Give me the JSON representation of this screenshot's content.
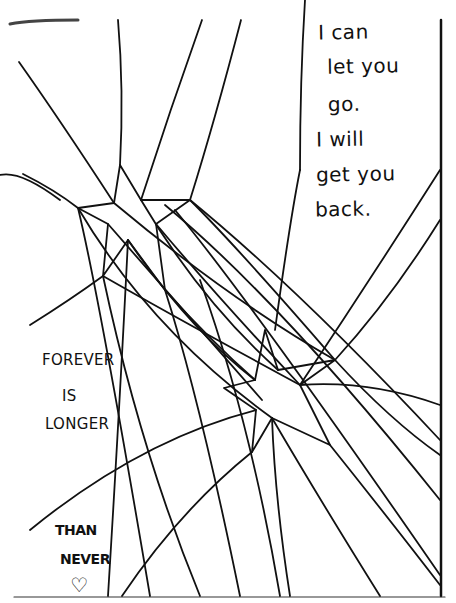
{
  "artwork": {
    "description": "Hand-drawn ink sketch of two shattered stars connected by many radiating lines, with handwritten text",
    "ink_color": "#111111",
    "paper_color": "#ffffff",
    "quote_right": {
      "lines": [
        "I can",
        "let you",
        "go.",
        "I will",
        "get you",
        "back."
      ]
    },
    "quote_left": {
      "lines": [
        "FOREVER",
        "IS",
        "LONGER"
      ]
    },
    "quote_bottom": {
      "lines": [
        "THAN",
        "NEVER"
      ],
      "symbol": "♡"
    }
  }
}
